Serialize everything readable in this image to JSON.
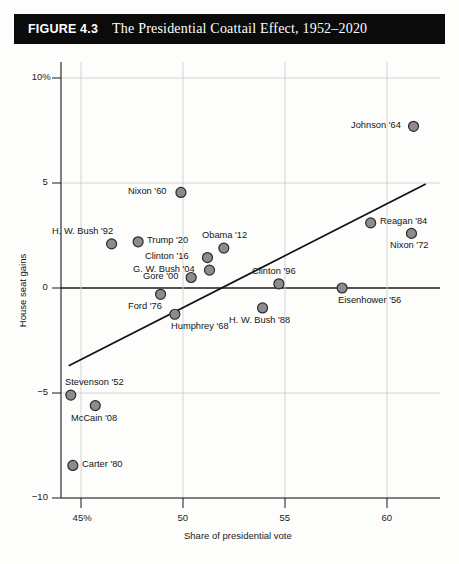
{
  "figure": {
    "number": "FIGURE 4.3",
    "title": "The Presidential Coattail Effect, 1952–2020"
  },
  "colors": {
    "title_bar_bg": "#0b0b0b",
    "title_text": "#ffffff",
    "marker_fill": "#8c8c8c",
    "marker_stroke": "#2b2b2b",
    "axis": "#1a1a1a",
    "gridline": "#cfcfcf",
    "trendline": "#111111",
    "page_bg": "#fdfdfc"
  },
  "chart_data": {
    "type": "scatter",
    "title": "The Presidential Coattail Effect, 1952–2020",
    "xlabel": "Share of presidential vote",
    "ylabel": "House seat gains",
    "xlim": [
      43.5,
      62.5
    ],
    "ylim": [
      -10.5,
      11.0
    ],
    "xticks": [
      "45%",
      "50",
      "55",
      "60"
    ],
    "xtick_values": [
      45,
      50,
      55,
      60
    ],
    "yticks": [
      "10%",
      "5",
      "0",
      "-5",
      "-10"
    ],
    "ytick_values": [
      10,
      5,
      0,
      -5,
      -10
    ],
    "grid": true,
    "legend": "none",
    "trendline": {
      "type": "linear-fit",
      "x_start": 44.4,
      "y_start": -3.7,
      "x_end": 61.9,
      "y_end": 4.95
    },
    "points": [
      {
        "label": "Johnson '64",
        "x": 61.3,
        "y": 7.7,
        "label_pos": "left"
      },
      {
        "label": "Nixon '60",
        "x": 49.9,
        "y": 4.55,
        "label_pos": "left"
      },
      {
        "label": "Reagan '84",
        "x": 59.2,
        "y": 3.1,
        "label_pos": "right"
      },
      {
        "label": "Nixon '72",
        "x": 61.2,
        "y": 2.6,
        "label_pos": "below"
      },
      {
        "label": "H. W. Bush '92",
        "x": 46.5,
        "y": 2.1,
        "label_pos": "above-left"
      },
      {
        "label": "Trump '20",
        "x": 47.8,
        "y": 2.2,
        "label_pos": "right"
      },
      {
        "label": "Obama '12",
        "x": 52.0,
        "y": 1.9,
        "label_pos": "above"
      },
      {
        "label": "Clinton '16",
        "x": 51.2,
        "y": 1.45,
        "label_pos": "left"
      },
      {
        "label": "G. W. Bush '04",
        "x": 51.3,
        "y": 0.85,
        "label_pos": "left"
      },
      {
        "label": "Gore '00",
        "x": 50.4,
        "y": 0.5,
        "label_pos": "left"
      },
      {
        "label": "Ford '76",
        "x": 48.9,
        "y": -0.3,
        "label_pos": "below-left"
      },
      {
        "label": "Clinton '96",
        "x": 54.7,
        "y": 0.2,
        "label_pos": "above"
      },
      {
        "label": "Eisenhower '56",
        "x": 57.8,
        "y": 0.0,
        "label_pos": "below-right"
      },
      {
        "label": "Humphrey '68",
        "x": 49.6,
        "y": -1.25,
        "label_pos": "below-right"
      },
      {
        "label": "H. W. Bush '88",
        "x": 53.9,
        "y": -0.95,
        "label_pos": "below"
      },
      {
        "label": "Stevenson '52",
        "x": 44.5,
        "y": -5.1,
        "label_pos": "above-right"
      },
      {
        "label": "McCain '08",
        "x": 45.7,
        "y": -5.6,
        "label_pos": "below"
      },
      {
        "label": "Carter '80",
        "x": 44.6,
        "y": -8.45,
        "label_pos": "right"
      }
    ]
  }
}
